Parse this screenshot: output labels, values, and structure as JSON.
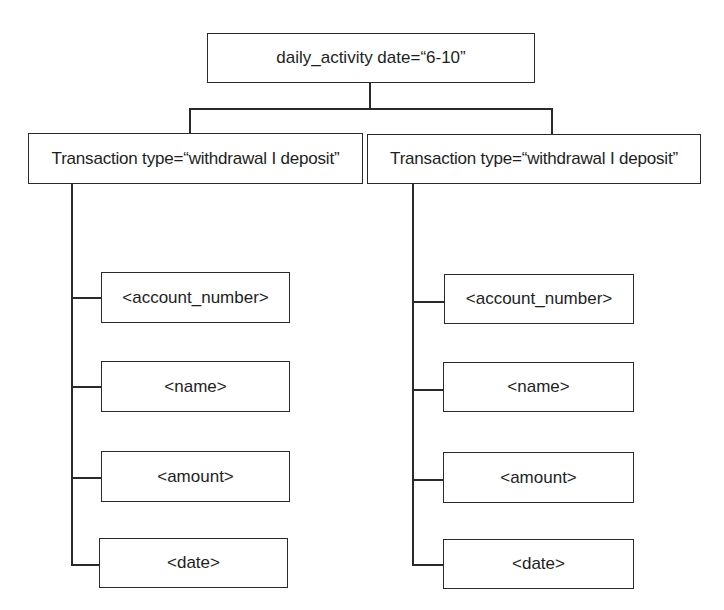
{
  "diagram": {
    "root": {
      "label": "daily_activity date=“6-10”"
    },
    "branches": [
      {
        "label": "Transaction type=“withdrawal I deposit”",
        "children": [
          {
            "label": "<account_number>"
          },
          {
            "label": "<name>"
          },
          {
            "label": "<amount>"
          },
          {
            "label": "<date>"
          }
        ]
      },
      {
        "label": "Transaction type=“withdrawal I deposit”",
        "children": [
          {
            "label": "<account_number>"
          },
          {
            "label": "<name>"
          },
          {
            "label": "<amount>"
          },
          {
            "label": "<date>"
          }
        ]
      }
    ]
  },
  "colors": {
    "stroke": "#2a2a2a",
    "text": "#1e1e1e",
    "background": "#ffffff"
  }
}
